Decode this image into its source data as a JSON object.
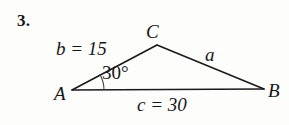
{
  "problem": {
    "number": "3."
  },
  "figure": {
    "type": "triangle-diagram",
    "vertices": [
      {
        "name": "A",
        "label": "A",
        "x": 72,
        "y": 90
      },
      {
        "name": "B",
        "label": "B",
        "x": 264,
        "y": 89
      },
      {
        "name": "C",
        "label": "C",
        "x": 157,
        "y": 45
      }
    ],
    "sides": [
      {
        "name": "a",
        "label": "a",
        "from": "B",
        "to": "C",
        "value": null
      },
      {
        "name": "b",
        "label": "b = 15",
        "from": "A",
        "to": "C",
        "value": 15
      },
      {
        "name": "c",
        "label": "c = 30",
        "from": "A",
        "to": "B",
        "value": 30
      }
    ],
    "angles": [
      {
        "at": "A",
        "label": "30°",
        "value": 30
      }
    ],
    "stroke_color": "#1a1a1e",
    "background_color": "#fdfdfb"
  }
}
